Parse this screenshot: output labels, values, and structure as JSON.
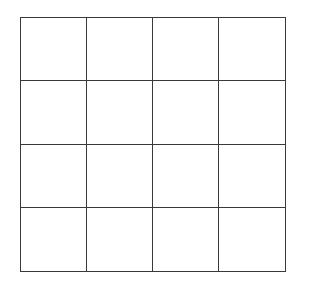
{
  "board": {
    "rows": 4,
    "cols": 4,
    "line_color": "#3a3a3a",
    "background": "#ffffff",
    "cells": [
      [
        "",
        "",
        "",
        ""
      ],
      [
        "",
        "",
        "",
        ""
      ],
      [
        "",
        "",
        "",
        ""
      ],
      [
        "",
        "",
        "",
        ""
      ]
    ]
  }
}
